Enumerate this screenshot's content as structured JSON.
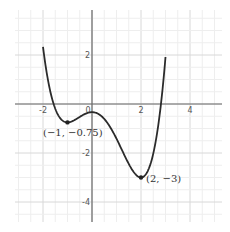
{
  "chart_data": {
    "type": "line",
    "title": "",
    "xlabel": "",
    "ylabel": "",
    "function": "f(x) = x^4/4 - x^3/3 - x^2 - 1/3",
    "domain": [
      -2,
      3
    ],
    "xlim": [
      -3.1,
      5.3
    ],
    "ylim": [
      -4.8,
      3.8
    ],
    "grid": true,
    "x_ticks": [
      {
        "value": -2,
        "label": "-2"
      },
      {
        "value": 0,
        "label": "0"
      },
      {
        "value": 2,
        "label": "2"
      },
      {
        "value": 4,
        "label": "4"
      }
    ],
    "y_ticks": [
      {
        "value": 2,
        "label": "2"
      },
      {
        "value": -2,
        "label": "-2"
      },
      {
        "value": -4,
        "label": "-4"
      }
    ],
    "series": [
      {
        "name": "f(x)",
        "x": [
          -2,
          -1.5,
          -1,
          -0.5,
          0,
          0.5,
          1,
          1.5,
          2,
          2.5,
          3
        ],
        "y": [
          2.33,
          0.03,
          -0.75,
          -0.53,
          -0.33,
          -0.61,
          -1.42,
          -2.43,
          -3.0,
          -2.14,
          1.92
        ]
      }
    ],
    "annotations": [
      {
        "x": -1,
        "y": -0.75,
        "label": "(−1, −0.75)"
      },
      {
        "x": 2,
        "y": -3,
        "label": "(2, −3)"
      }
    ]
  },
  "labels": {
    "point_a": "(−1, −0.75)",
    "point_b": "(2, −3)"
  }
}
